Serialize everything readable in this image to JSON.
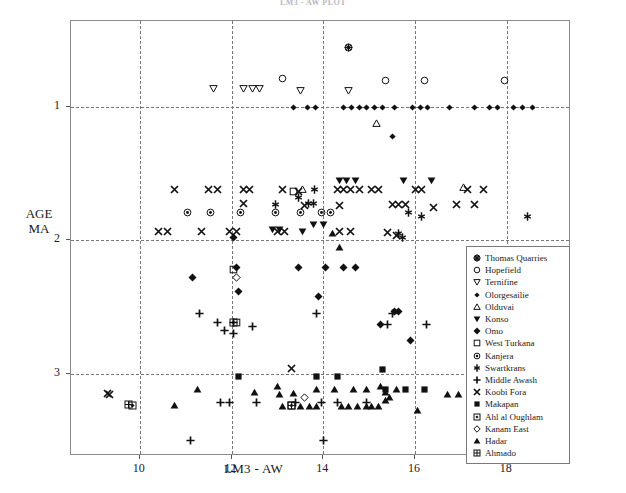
{
  "chart_title": "LM3 - AW PLOT",
  "axes": {
    "ylabel_line1": "AGE",
    "ylabel_line2": "MA",
    "xlabel": "LM3 - AW",
    "yticks": [
      "1",
      "2",
      "3"
    ],
    "xticks": [
      "10",
      "12",
      "14",
      "16",
      "18"
    ]
  },
  "legend": {
    "entries": [
      {
        "label": "Thomas Quarries",
        "symbol": "asterisk-circle"
      },
      {
        "label": "Hopefield",
        "symbol": "open-circle"
      },
      {
        "label": "Ternifine",
        "symbol": "open-down-triangle"
      },
      {
        "label": "Olorgesailie",
        "symbol": "filled-diamond-small"
      },
      {
        "label": "Olduvai",
        "symbol": "open-up-triangle"
      },
      {
        "label": "Konso",
        "symbol": "filled-down-triangle"
      },
      {
        "label": "Omo",
        "symbol": "filled-diamond"
      },
      {
        "label": "West Turkana",
        "symbol": "open-square"
      },
      {
        "label": "Kanjera",
        "symbol": "circle-dot"
      },
      {
        "label": "Swartkrans",
        "symbol": "star-vertical"
      },
      {
        "label": "Middle Awash",
        "symbol": "plus"
      },
      {
        "label": "Koobi Fora",
        "symbol": "cross-x"
      },
      {
        "label": "Makapan",
        "symbol": "filled-square"
      },
      {
        "label": "Ahl al Oughlam",
        "symbol": "square-diamond"
      },
      {
        "label": "Kanam East",
        "symbol": "open-diamond"
      },
      {
        "label": "Hadar",
        "symbol": "filled-up-triangle"
      },
      {
        "label": "Ahmado",
        "symbol": "grid-square"
      }
    ]
  },
  "chart_data": {
    "type": "scatter",
    "title": "LM3 - AW PLOT",
    "xlabel": "LM3 - AW",
    "ylabel": "AGE MA",
    "xlim": [
      8.5,
      19.4
    ],
    "ylim": [
      0.35,
      3.62
    ],
    "y_axis_inverted": true,
    "grid": true,
    "legend_position": "inside-right",
    "xticks": [
      10,
      12,
      14,
      16,
      18
    ],
    "yticks": [
      1,
      2,
      3
    ],
    "series": [
      {
        "name": "Thomas Quarries",
        "symbol": "asterisk-circle",
        "points": [
          [
            14.55,
            0.55
          ]
        ]
      },
      {
        "name": "Hopefield",
        "symbol": "open-circle",
        "points": [
          [
            13.1,
            0.78
          ],
          [
            15.35,
            0.8
          ],
          [
            16.2,
            0.8
          ],
          [
            17.95,
            0.8
          ]
        ]
      },
      {
        "name": "Ternifine",
        "symbol": "open-down-triangle",
        "points": [
          [
            11.6,
            0.86
          ],
          [
            12.25,
            0.86
          ],
          [
            12.45,
            0.86
          ],
          [
            12.62,
            0.86
          ],
          [
            13.5,
            0.87
          ],
          [
            14.55,
            0.87
          ]
        ]
      },
      {
        "name": "Olorgesailie",
        "symbol": "filled-diamond-small",
        "points": [
          [
            13.35,
            1.0
          ],
          [
            13.65,
            1.0
          ],
          [
            13.82,
            1.0
          ],
          [
            14.45,
            1.0
          ],
          [
            14.62,
            1.0
          ],
          [
            14.78,
            1.0
          ],
          [
            14.95,
            1.0
          ],
          [
            15.12,
            1.0
          ],
          [
            15.3,
            1.0
          ],
          [
            15.55,
            1.0
          ],
          [
            15.95,
            1.0
          ],
          [
            16.12,
            1.0
          ],
          [
            16.28,
            1.0
          ],
          [
            16.75,
            1.0
          ],
          [
            17.3,
            1.0
          ],
          [
            17.62,
            1.0
          ],
          [
            17.8,
            1.0
          ],
          [
            18.15,
            1.0
          ],
          [
            18.35,
            1.0
          ],
          [
            18.55,
            1.0
          ],
          [
            15.5,
            1.22
          ]
        ]
      },
      {
        "name": "Olduvai",
        "symbol": "open-up-triangle",
        "points": [
          [
            15.15,
            1.12
          ],
          [
            13.55,
            1.62
          ],
          [
            17.05,
            1.6
          ]
        ]
      },
      {
        "name": "Konso",
        "symbol": "filled-down-triangle",
        "points": [
          [
            14.35,
            1.55
          ],
          [
            14.5,
            1.55
          ],
          [
            14.7,
            1.55
          ],
          [
            15.75,
            1.55
          ],
          [
            16.35,
            1.55
          ],
          [
            12.9,
            1.92
          ],
          [
            13.05,
            1.92
          ],
          [
            13.55,
            1.93
          ],
          [
            13.78,
            1.88
          ],
          [
            14.0,
            1.88
          ]
        ]
      },
      {
        "name": "Omo",
        "symbol": "filled-diamond",
        "points": [
          [
            11.15,
            2.28
          ],
          [
            12.1,
            2.2
          ],
          [
            12.15,
            2.38
          ],
          [
            13.45,
            2.2
          ],
          [
            14.05,
            2.2
          ],
          [
            14.45,
            2.2
          ],
          [
            14.7,
            2.2
          ],
          [
            13.9,
            2.42
          ],
          [
            15.55,
            2.53
          ],
          [
            15.65,
            2.53
          ],
          [
            15.25,
            2.63
          ],
          [
            15.9,
            2.75
          ],
          [
            12.05,
            1.98
          ]
        ]
      },
      {
        "name": "West Turkana",
        "symbol": "open-square",
        "points": [
          [
            13.35,
            1.63
          ],
          [
            12.05,
            2.22
          ],
          [
            12.1,
            2.62
          ]
        ]
      },
      {
        "name": "Kanjera",
        "symbol": "circle-dot",
        "points": [
          [
            11.05,
            1.79
          ],
          [
            11.55,
            1.79
          ],
          [
            12.2,
            1.79
          ],
          [
            12.95,
            1.79
          ],
          [
            13.5,
            1.79
          ],
          [
            13.95,
            1.79
          ],
          [
            14.15,
            1.79
          ]
        ]
      },
      {
        "name": "Swartkrans",
        "symbol": "star-vertical",
        "points": [
          [
            13.45,
            1.68
          ],
          [
            13.68,
            1.72
          ],
          [
            13.8,
            1.62
          ],
          [
            13.78,
            1.72
          ],
          [
            12.95,
            1.73
          ],
          [
            15.85,
            1.79
          ],
          [
            16.15,
            1.82
          ],
          [
            18.45,
            1.82
          ],
          [
            15.65,
            1.95
          ],
          [
            15.72,
            1.98
          ]
        ]
      },
      {
        "name": "Middle Awash",
        "symbol": "plus",
        "points": [
          [
            11.3,
            2.55
          ],
          [
            12.05,
            2.7
          ],
          [
            12.45,
            2.65
          ],
          [
            11.7,
            2.62
          ],
          [
            11.85,
            2.68
          ],
          [
            12.05,
            2.62
          ],
          [
            13.85,
            2.55
          ],
          [
            15.5,
            2.55
          ],
          [
            15.4,
            2.63
          ],
          [
            16.25,
            2.63
          ],
          [
            11.75,
            3.22
          ],
          [
            11.95,
            3.22
          ],
          [
            12.55,
            3.22
          ],
          [
            13.4,
            3.22
          ],
          [
            13.95,
            3.22
          ],
          [
            14.3,
            3.22
          ],
          [
            14.95,
            3.22
          ],
          [
            11.1,
            3.5
          ],
          [
            14.0,
            3.5
          ]
        ]
      },
      {
        "name": "Koobi Fora",
        "symbol": "cross-x",
        "points": [
          [
            10.75,
            1.62
          ],
          [
            11.5,
            1.62
          ],
          [
            11.7,
            1.62
          ],
          [
            12.25,
            1.62
          ],
          [
            12.4,
            1.62
          ],
          [
            13.1,
            1.62
          ],
          [
            13.45,
            1.63
          ],
          [
            14.3,
            1.62
          ],
          [
            14.45,
            1.62
          ],
          [
            14.6,
            1.62
          ],
          [
            14.78,
            1.62
          ],
          [
            15.05,
            1.62
          ],
          [
            15.2,
            1.62
          ],
          [
            16.0,
            1.62
          ],
          [
            16.15,
            1.62
          ],
          [
            17.15,
            1.62
          ],
          [
            17.5,
            1.62
          ],
          [
            12.25,
            1.72
          ],
          [
            13.6,
            1.74
          ],
          [
            14.35,
            1.74
          ],
          [
            15.5,
            1.73
          ],
          [
            15.65,
            1.73
          ],
          [
            15.8,
            1.73
          ],
          [
            16.4,
            1.75
          ],
          [
            16.9,
            1.73
          ],
          [
            17.3,
            1.73
          ],
          [
            10.4,
            1.93
          ],
          [
            10.6,
            1.93
          ],
          [
            11.35,
            1.93
          ],
          [
            11.95,
            1.93
          ],
          [
            12.1,
            1.93
          ],
          [
            13.0,
            1.93
          ],
          [
            13.15,
            1.93
          ],
          [
            14.35,
            1.93
          ],
          [
            14.6,
            1.93
          ],
          [
            15.4,
            1.94
          ],
          [
            15.6,
            1.96
          ],
          [
            13.3,
            2.96
          ],
          [
            9.3,
            3.15
          ],
          [
            9.35,
            3.16
          ]
        ]
      },
      {
        "name": "Makapan",
        "symbol": "filled-square",
        "points": [
          [
            12.15,
            3.02
          ],
          [
            13.85,
            3.02
          ],
          [
            14.3,
            3.02
          ],
          [
            15.3,
            2.97
          ],
          [
            17.55,
            2.97
          ],
          [
            17.9,
            2.97
          ],
          [
            15.35,
            3.12
          ],
          [
            15.8,
            3.12
          ],
          [
            16.2,
            3.12
          ],
          [
            17.35,
            3.12
          ]
        ]
      },
      {
        "name": "Ahl al Oughlam",
        "symbol": "square-diamond",
        "points": [
          [
            12.05,
            2.62
          ],
          [
            9.85,
            3.24
          ],
          [
            13.3,
            3.24
          ]
        ]
      },
      {
        "name": "Kanam East",
        "symbol": "open-diamond",
        "points": [
          [
            12.1,
            2.28
          ],
          [
            13.6,
            3.18
          ]
        ]
      },
      {
        "name": "Hadar",
        "symbol": "filled-up-triangle",
        "points": [
          [
            11.25,
            3.12
          ],
          [
            12.5,
            3.14
          ],
          [
            13.0,
            3.1
          ],
          [
            13.05,
            3.16
          ],
          [
            13.35,
            3.15
          ],
          [
            13.85,
            3.12
          ],
          [
            14.25,
            3.12
          ],
          [
            14.65,
            3.12
          ],
          [
            14.95,
            3.12
          ],
          [
            15.25,
            3.1
          ],
          [
            15.35,
            3.14
          ],
          [
            15.45,
            3.18
          ],
          [
            15.6,
            3.12
          ],
          [
            16.7,
            3.16
          ],
          [
            16.95,
            3.16
          ],
          [
            10.75,
            3.24
          ],
          [
            13.1,
            3.25
          ],
          [
            13.5,
            3.25
          ],
          [
            13.7,
            3.25
          ],
          [
            13.85,
            3.25
          ],
          [
            14.4,
            3.25
          ],
          [
            14.55,
            3.25
          ],
          [
            14.75,
            3.25
          ],
          [
            14.95,
            3.25
          ],
          [
            15.05,
            3.25
          ],
          [
            15.2,
            3.25
          ],
          [
            15.35,
            3.2
          ],
          [
            16.05,
            3.28
          ],
          [
            14.2,
            1.95
          ],
          [
            14.35,
            2.05
          ]
        ]
      },
      {
        "name": "Ahmado",
        "symbol": "grid-square",
        "points": [
          [
            9.75,
            3.23
          ],
          [
            13.3,
            3.24
          ]
        ]
      }
    ]
  }
}
